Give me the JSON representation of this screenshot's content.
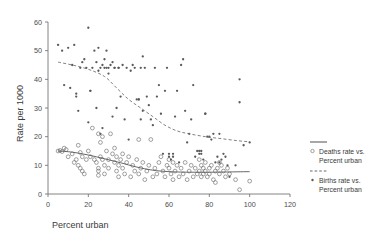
{
  "chart_data": {
    "type": "scatter",
    "title": "",
    "xlabel": "Percent urban",
    "ylabel": "Rate per 1000",
    "xlim": [
      0,
      120
    ],
    "ylim": [
      0,
      60
    ],
    "xticks": [
      0,
      20,
      40,
      60,
      80,
      100,
      120
    ],
    "yticks": [
      0,
      10,
      20,
      30,
      40,
      50,
      60
    ],
    "grid": false,
    "legend_position": "right",
    "series": [
      {
        "name": "Deaths rate vs. Percent urban",
        "marker": "open-circle",
        "trend_style": "solid",
        "points": [
          [
            5,
            15
          ],
          [
            6,
            15.2
          ],
          [
            7,
            14.8
          ],
          [
            8,
            16
          ],
          [
            9,
            15.5
          ],
          [
            10,
            13
          ],
          [
            12,
            14
          ],
          [
            13,
            11
          ],
          [
            14,
            12
          ],
          [
            15,
            10
          ],
          [
            15,
            17
          ],
          [
            16,
            14.5
          ],
          [
            16,
            9
          ],
          [
            17,
            13
          ],
          [
            17,
            8
          ],
          [
            18,
            7
          ],
          [
            19,
            12
          ],
          [
            20,
            15
          ],
          [
            21,
            13
          ],
          [
            22,
            23
          ],
          [
            23,
            12
          ],
          [
            24,
            11
          ],
          [
            25,
            9
          ],
          [
            25,
            21
          ],
          [
            25,
            8
          ],
          [
            25,
            6.5
          ],
          [
            26,
            13
          ],
          [
            26,
            18
          ],
          [
            27,
            12
          ],
          [
            27,
            20
          ],
          [
            28,
            10
          ],
          [
            28,
            7
          ],
          [
            29,
            15
          ],
          [
            30,
            12
          ],
          [
            30,
            9
          ],
          [
            31,
            21
          ],
          [
            32,
            14
          ],
          [
            33,
            11
          ],
          [
            33,
            16
          ],
          [
            34,
            8
          ],
          [
            34,
            13
          ],
          [
            35,
            10
          ],
          [
            35,
            6
          ],
          [
            36,
            12
          ],
          [
            37,
            14
          ],
          [
            37,
            9
          ],
          [
            38,
            7
          ],
          [
            39,
            11
          ],
          [
            40,
            13
          ],
          [
            41,
            6
          ],
          [
            42,
            10
          ],
          [
            43,
            8
          ],
          [
            44,
            12
          ],
          [
            45,
            19
          ],
          [
            45,
            7
          ],
          [
            46,
            9
          ],
          [
            47,
            11
          ],
          [
            48,
            5
          ],
          [
            49,
            8
          ],
          [
            50,
            10
          ],
          [
            51,
            19
          ],
          [
            52,
            6
          ],
          [
            53,
            9
          ],
          [
            54,
            7
          ],
          [
            55,
            11
          ],
          [
            56,
            13
          ],
          [
            57,
            8
          ],
          [
            58,
            6
          ],
          [
            59,
            10
          ],
          [
            60,
            12
          ],
          [
            60,
            9
          ],
          [
            61,
            7
          ],
          [
            62,
            11
          ],
          [
            62,
            5
          ],
          [
            63,
            8
          ],
          [
            64,
            10
          ],
          [
            65,
            6
          ],
          [
            66,
            9
          ],
          [
            67,
            7
          ],
          [
            68,
            11
          ],
          [
            69,
            5
          ],
          [
            70,
            8
          ],
          [
            71,
            10
          ],
          [
            72,
            6
          ],
          [
            73,
            9
          ],
          [
            74,
            7
          ],
          [
            75,
            12
          ],
          [
            75,
            8
          ],
          [
            76,
            10
          ],
          [
            76,
            6
          ],
          [
            77,
            9
          ],
          [
            77,
            7
          ],
          [
            78,
            8
          ],
          [
            78,
            11
          ],
          [
            79,
            6
          ],
          [
            80,
            9
          ],
          [
            80,
            7
          ],
          [
            81,
            10
          ],
          [
            82,
            5
          ],
          [
            83,
            8
          ],
          [
            83,
            4
          ],
          [
            84,
            9
          ],
          [
            85,
            7
          ],
          [
            85,
            11
          ],
          [
            86,
            10
          ],
          [
            87,
            8
          ],
          [
            88,
            6
          ],
          [
            89,
            9
          ],
          [
            90,
            7
          ],
          [
            93,
            5
          ],
          [
            95,
            1.5
          ],
          [
            100,
            4.5
          ]
        ],
        "trend": [
          [
            5,
            15
          ],
          [
            12,
            14.6
          ],
          [
            20,
            13.6
          ],
          [
            28,
            12.3
          ],
          [
            36,
            10.9
          ],
          [
            44,
            9.4
          ],
          [
            52,
            8.3
          ],
          [
            60,
            7.8
          ],
          [
            70,
            7.6
          ],
          [
            80,
            7.6
          ],
          [
            90,
            7.7
          ],
          [
            100,
            7.8
          ]
        ]
      },
      {
        "name": "Births rate vs. Percent urban",
        "marker": "filled-circle",
        "trend_style": "dashed",
        "points": [
          [
            5,
            52
          ],
          [
            7,
            50
          ],
          [
            8,
            38
          ],
          [
            10,
            51
          ],
          [
            11,
            37
          ],
          [
            12,
            45
          ],
          [
            13,
            52
          ],
          [
            14,
            34
          ],
          [
            14,
            35
          ],
          [
            15,
            29
          ],
          [
            16,
            44
          ],
          [
            17,
            46
          ],
          [
            18,
            47
          ],
          [
            19,
            44
          ],
          [
            20,
            25
          ],
          [
            20,
            58
          ],
          [
            21,
            36
          ],
          [
            21,
            36
          ],
          [
            22,
            44
          ],
          [
            23,
            50
          ],
          [
            24,
            30
          ],
          [
            24,
            46
          ],
          [
            25,
            51
          ],
          [
            25,
            43
          ],
          [
            26,
            44
          ],
          [
            26,
            21
          ],
          [
            27,
            45
          ],
          [
            27,
            23
          ],
          [
            28,
            47
          ],
          [
            28,
            44
          ],
          [
            29,
            50
          ],
          [
            29,
            44
          ],
          [
            30,
            42
          ],
          [
            30,
            44
          ],
          [
            31,
            45
          ],
          [
            32,
            46
          ],
          [
            32,
            27
          ],
          [
            33,
            44
          ],
          [
            33,
            44
          ],
          [
            34,
            30
          ],
          [
            35,
            44
          ],
          [
            35,
            44
          ],
          [
            36,
            34
          ],
          [
            37,
            45
          ],
          [
            38,
            26
          ],
          [
            39,
            44
          ],
          [
            40,
            19
          ],
          [
            41,
            43
          ],
          [
            42,
            45
          ],
          [
            43,
            44
          ],
          [
            44,
            33
          ],
          [
            45,
            33
          ],
          [
            45,
            33
          ],
          [
            46,
            44
          ],
          [
            46,
            26
          ],
          [
            47,
            48
          ],
          [
            47,
            29
          ],
          [
            48,
            44
          ],
          [
            49,
            34
          ],
          [
            50,
            31
          ],
          [
            51,
            26
          ],
          [
            52,
            24
          ],
          [
            53,
            44
          ],
          [
            54,
            34
          ],
          [
            55,
            38
          ],
          [
            56,
            28
          ],
          [
            57,
            14
          ],
          [
            58,
            36
          ],
          [
            59,
            44
          ],
          [
            60,
            13
          ],
          [
            60,
            14
          ],
          [
            61,
            12
          ],
          [
            62,
            14
          ],
          [
            62,
            13
          ],
          [
            63,
            27
          ],
          [
            64,
            36
          ],
          [
            65,
            11
          ],
          [
            66,
            45
          ],
          [
            67,
            47
          ],
          [
            68,
            29
          ],
          [
            69,
            18
          ],
          [
            70,
            21
          ],
          [
            71,
            26
          ],
          [
            72,
            38
          ],
          [
            73,
            13
          ],
          [
            74,
            15
          ],
          [
            75,
            14
          ],
          [
            75,
            15
          ],
          [
            76,
            14
          ],
          [
            76,
            15
          ],
          [
            77,
            12
          ],
          [
            78,
            28
          ],
          [
            78,
            28
          ],
          [
            79,
            20
          ],
          [
            80,
            20
          ],
          [
            81,
            19
          ],
          [
            82,
            21
          ],
          [
            83,
            11
          ],
          [
            84,
            13
          ],
          [
            85,
            21
          ],
          [
            85,
            11
          ],
          [
            86,
            12
          ],
          [
            87,
            14
          ],
          [
            88,
            13
          ],
          [
            89,
            10
          ],
          [
            90,
            6
          ],
          [
            93,
            10
          ],
          [
            95,
            40
          ],
          [
            95,
            32
          ],
          [
            97,
            17
          ],
          [
            100,
            18
          ]
        ],
        "trend": [
          [
            5,
            46
          ],
          [
            12,
            45
          ],
          [
            20,
            43.5
          ],
          [
            28,
            41
          ],
          [
            34,
            37
          ],
          [
            40,
            33
          ],
          [
            46,
            30
          ],
          [
            52,
            27
          ],
          [
            58,
            24
          ],
          [
            64,
            22
          ],
          [
            70,
            21
          ],
          [
            78,
            20
          ],
          [
            86,
            19.3
          ],
          [
            94,
            18.6
          ],
          [
            100,
            18.2
          ]
        ]
      }
    ]
  },
  "legend": {
    "items": [
      {
        "line_style": "solid",
        "marker": "open-circle",
        "label_line1": "Deaths rate vs.",
        "label_line2": "Percent urban"
      },
      {
        "line_style": "dashed",
        "marker": "filled-circle",
        "label_line1": "Births rate vs.",
        "label_line2": "Percent urban"
      }
    ]
  },
  "axes": {
    "x_title": "Percent urban",
    "y_title": "Rate per 1000",
    "x_tick_labels": [
      "0",
      "20",
      "40",
      "60",
      "80",
      "100",
      "120"
    ],
    "y_tick_labels": [
      "0",
      "10",
      "20",
      "30",
      "40",
      "50",
      "60"
    ]
  }
}
